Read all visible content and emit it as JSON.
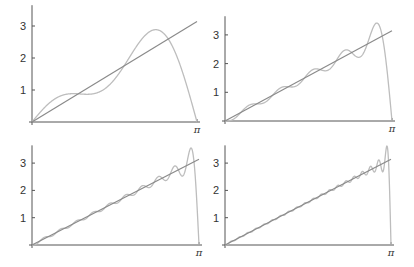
{
  "chart_data": [
    {
      "type": "line",
      "title": "",
      "xlabel": "",
      "ylabel": "",
      "x_range": [
        0,
        3.14159
      ],
      "x_ticks": [
        "π"
      ],
      "y_ticks": [
        "1",
        "2",
        "3"
      ],
      "grid": false,
      "legend": "none",
      "series": [
        {
          "name": "x",
          "description": "straight line y = x",
          "color": "#8a8a8a"
        },
        {
          "name": "Fourier sine partial sum",
          "terms": 3,
          "color": "#bdbdbd",
          "peak": {
            "x": 2.36,
            "y": 2.89
          }
        }
      ]
    },
    {
      "type": "line",
      "title": "",
      "xlabel": "",
      "ylabel": "",
      "x_range": [
        0,
        3.14159
      ],
      "x_ticks": [
        "π"
      ],
      "y_ticks": [
        "1",
        "2",
        "3"
      ],
      "grid": false,
      "legend": "none",
      "series": [
        {
          "name": "x",
          "description": "straight line y = x",
          "color": "#8a8a8a"
        },
        {
          "name": "Fourier sine partial sum",
          "terms": 10,
          "color": "#bdbdbd",
          "peak": {
            "x": 2.89,
            "y": 3.45
          }
        }
      ]
    },
    {
      "type": "line",
      "title": "",
      "xlabel": "",
      "ylabel": "",
      "x_range": [
        0,
        3.14159
      ],
      "x_ticks": [
        "π"
      ],
      "y_ticks": [
        "1",
        "2",
        "3"
      ],
      "grid": false,
      "legend": "none",
      "series": [
        {
          "name": "x",
          "description": "straight line y = x",
          "color": "#8a8a8a"
        },
        {
          "name": "Fourier sine partial sum",
          "terms": 20,
          "color": "#bdbdbd",
          "peak": {
            "x": 3.0,
            "y": 3.5
          }
        }
      ]
    },
    {
      "type": "line",
      "title": "",
      "xlabel": "",
      "ylabel": "",
      "x_range": [
        0,
        3.14159
      ],
      "x_ticks": [
        "π"
      ],
      "y_ticks": [
        "1",
        "2",
        "3"
      ],
      "grid": false,
      "legend": "none",
      "series": [
        {
          "name": "x",
          "description": "straight line y = x",
          "color": "#8a8a8a"
        },
        {
          "name": "Fourier sine partial sum",
          "terms": 40,
          "color": "#bdbdbd",
          "peak": {
            "x": 3.06,
            "y": 3.6
          }
        }
      ]
    }
  ],
  "panels": [
    {
      "id": "top-left",
      "x0": 32,
      "y0": 122,
      "xpi": 197,
      "unit": 32.0
    },
    {
      "id": "top-right",
      "x0": 225,
      "y0": 121,
      "xpi": 392,
      "unit": 28.7
    },
    {
      "id": "bottom-left",
      "x0": 32,
      "y0": 245,
      "xpi": 199,
      "unit": 27.3
    },
    {
      "id": "bottom-right",
      "x0": 225,
      "y0": 245,
      "xpi": 391,
      "unit": 27.3
    }
  ],
  "colors": {
    "axis": "#555555",
    "line": "#8a8a8a",
    "curve": "#bdbdbd"
  }
}
